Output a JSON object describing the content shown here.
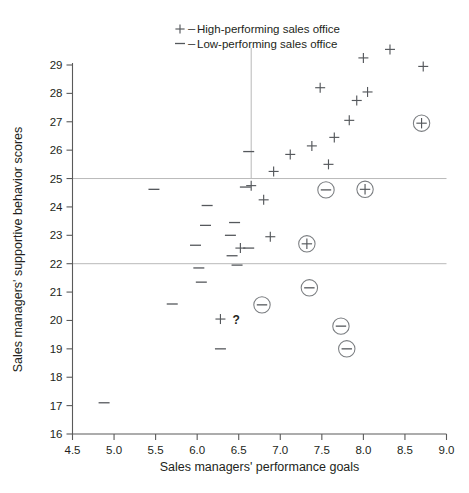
{
  "chart_data": {
    "type": "scatter",
    "title": "",
    "xlabel": "Sales managers' performance goals",
    "ylabel": "Sales managers' supportive behavior scores",
    "xlim": [
      4.5,
      9.0
    ],
    "ylim": [
      16,
      29
    ],
    "xticks": [
      "4.5",
      "5.0",
      "5.5",
      "6.0",
      "6.5",
      "7.0",
      "7.5",
      "8.0",
      "8.5",
      "9.0"
    ],
    "xtick_values": [
      4.5,
      5.0,
      5.5,
      6.0,
      6.5,
      7.0,
      7.5,
      8.0,
      8.5,
      9.0
    ],
    "yticks": [
      "16",
      "17",
      "18",
      "19",
      "20",
      "21",
      "22",
      "23",
      "24",
      "25",
      "26",
      "27",
      "28",
      "29"
    ],
    "ytick_values": [
      16,
      17,
      18,
      19,
      20,
      21,
      22,
      23,
      24,
      25,
      26,
      27,
      28,
      29
    ],
    "grid": false,
    "legend_position": "top-center",
    "legend": [
      {
        "symbol": "+",
        "dash": "–",
        "label": "High-performing sales office"
      },
      {
        "symbol": "—",
        "dash": "–",
        "label": "Low-performing sales office"
      }
    ],
    "reference_lines": [
      {
        "orientation": "horizontal",
        "value": 25.0,
        "label": ""
      },
      {
        "orientation": "horizontal",
        "value": 22.0,
        "label": ""
      },
      {
        "orientation": "vertical",
        "value": 6.65,
        "from": 29.6,
        "to": 25.0,
        "label": ""
      }
    ],
    "annotations": [
      {
        "text": "?",
        "x": 6.33,
        "y": 20.05
      }
    ],
    "series": [
      {
        "name": "High-performing sales office",
        "marker": "plus",
        "points": [
          {
            "x": 8.32,
            "y": 29.55
          },
          {
            "x": 8.72,
            "y": 28.95
          },
          {
            "x": 8.0,
            "y": 29.25
          },
          {
            "x": 7.48,
            "y": 28.2
          },
          {
            "x": 8.05,
            "y": 28.05
          },
          {
            "x": 7.92,
            "y": 27.75
          },
          {
            "x": 7.83,
            "y": 27.05
          },
          {
            "x": 7.65,
            "y": 26.45
          },
          {
            "x": 7.38,
            "y": 26.15
          },
          {
            "x": 7.12,
            "y": 25.85
          },
          {
            "x": 7.58,
            "y": 25.5
          },
          {
            "x": 6.92,
            "y": 25.25
          },
          {
            "x": 6.65,
            "y": 24.75
          },
          {
            "x": 6.8,
            "y": 24.25
          },
          {
            "x": 6.88,
            "y": 22.95
          },
          {
            "x": 6.52,
            "y": 22.55
          },
          {
            "x": 6.28,
            "y": 20.05
          }
        ]
      },
      {
        "name": "Low-performing sales office",
        "marker": "minus",
        "points": [
          {
            "x": 6.62,
            "y": 25.95
          },
          {
            "x": 5.48,
            "y": 24.62
          },
          {
            "x": 6.58,
            "y": 24.7
          },
          {
            "x": 6.12,
            "y": 24.05
          },
          {
            "x": 6.1,
            "y": 23.35
          },
          {
            "x": 6.45,
            "y": 23.45
          },
          {
            "x": 6.4,
            "y": 23.0
          },
          {
            "x": 6.42,
            "y": 22.28
          },
          {
            "x": 6.62,
            "y": 22.55
          },
          {
            "x": 5.98,
            "y": 22.65
          },
          {
            "x": 6.02,
            "y": 21.85
          },
          {
            "x": 6.48,
            "y": 21.95
          },
          {
            "x": 6.05,
            "y": 21.35
          },
          {
            "x": 5.7,
            "y": 20.58
          },
          {
            "x": 6.28,
            "y": 19.0
          },
          {
            "x": 4.88,
            "y": 17.1
          }
        ]
      },
      {
        "name": "High-performing sales office (circled)",
        "marker": "circled-plus",
        "points": [
          {
            "x": 8.7,
            "y": 26.95
          },
          {
            "x": 8.02,
            "y": 24.62
          },
          {
            "x": 7.32,
            "y": 22.7
          }
        ]
      },
      {
        "name": "Low-performing sales office (circled)",
        "marker": "circled-minus",
        "points": [
          {
            "x": 7.55,
            "y": 24.6
          },
          {
            "x": 6.78,
            "y": 20.55
          },
          {
            "x": 7.35,
            "y": 21.15
          },
          {
            "x": 7.73,
            "y": 19.8
          },
          {
            "x": 7.8,
            "y": 19.0
          }
        ]
      }
    ]
  }
}
